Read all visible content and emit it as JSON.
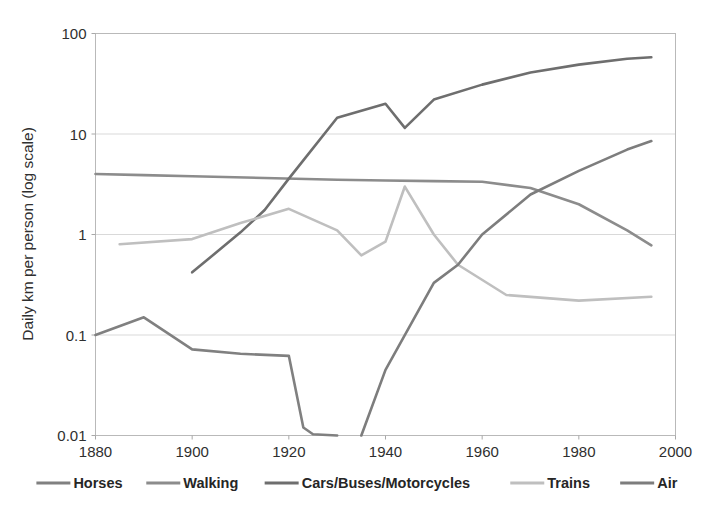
{
  "chart_data": {
    "type": "line",
    "title": "",
    "xlabel": "",
    "ylabel": "Daily km per person (log scale)",
    "xlim": [
      1880,
      2000
    ],
    "ylim": [
      0.01,
      100
    ],
    "yscale": "log",
    "grid": true,
    "legend_position": "bottom",
    "x_ticks": [
      "1880",
      "1900",
      "1920",
      "1940",
      "1960",
      "1980",
      "2000"
    ],
    "x_tick_values": [
      1880,
      1900,
      1920,
      1940,
      1960,
      1980,
      2000
    ],
    "y_ticks": [
      "100",
      "10",
      "1",
      "0.1",
      "0.01"
    ],
    "y_tick_values": [
      100,
      10,
      1,
      0.1,
      0.01
    ],
    "series": [
      {
        "name": "Horses",
        "color": "#808080",
        "x": [
          1880,
          1890,
          1900,
          1910,
          1920,
          1923,
          1925,
          1930
        ],
        "values": [
          0.1,
          0.15,
          0.072,
          0.065,
          0.062,
          0.012,
          0.0103,
          0.01
        ]
      },
      {
        "name": "Walking",
        "color": "#8c8c8c",
        "x": [
          1880,
          1890,
          1900,
          1915,
          1930,
          1940,
          1950,
          1960,
          1970,
          1980,
          1990,
          1995
        ],
        "values": [
          4.0,
          3.9,
          3.8,
          3.65,
          3.5,
          3.45,
          3.4,
          3.35,
          2.9,
          2.0,
          1.1,
          0.78
        ]
      },
      {
        "name": "Cars/Buses/Motorcycles",
        "color": "#6e6e6e",
        "x": [
          1900,
          1910,
          1915,
          1920,
          1930,
          1940,
          1944,
          1950,
          1960,
          1970,
          1980,
          1990,
          1995
        ],
        "values": [
          0.42,
          1.05,
          1.75,
          3.6,
          14.5,
          20.0,
          11.5,
          22.0,
          31.0,
          41.0,
          49.0,
          56.0,
          58.0
        ]
      },
      {
        "name": "Trains",
        "color": "#bfbfbf",
        "x": [
          1885,
          1900,
          1910,
          1920,
          1930,
          1935,
          1940,
          1944,
          1950,
          1955,
          1965,
          1980,
          1995
        ],
        "values": [
          0.8,
          0.9,
          1.3,
          1.8,
          1.1,
          0.62,
          0.85,
          3.0,
          1.0,
          0.5,
          0.25,
          0.22,
          0.24
        ]
      },
      {
        "name": "Air",
        "color": "#7d7d7d",
        "x": [
          1935,
          1940,
          1950,
          1955,
          1960,
          1970,
          1980,
          1990,
          1995
        ],
        "values": [
          0.01,
          0.045,
          0.33,
          0.5,
          1.0,
          2.5,
          4.3,
          7.0,
          8.5
        ]
      }
    ]
  },
  "legend": {
    "items": [
      {
        "label": "Horses"
      },
      {
        "label": "Walking"
      },
      {
        "label": "Cars/Buses/Motorcycles"
      },
      {
        "label": "Trains"
      },
      {
        "label": "Air"
      }
    ]
  }
}
